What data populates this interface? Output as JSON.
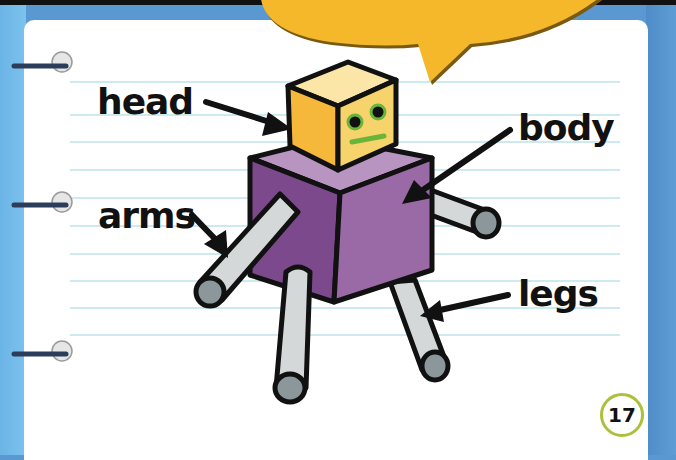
{
  "labels": {
    "head": "head",
    "body": "body",
    "arms": "arms",
    "legs": "legs"
  },
  "page_number": "17",
  "colors": {
    "background_blue": "#5a98d2",
    "page": "#ffffff",
    "ruled_line": "#cdeaf0",
    "speech_bubble": "#f5b82a",
    "head_front": "#f7d36b",
    "head_side": "#f5b83a",
    "head_top": "#fbe6a8",
    "body_front": "#9a6aa6",
    "body_side": "#7c4a8c",
    "body_top": "#b894c0",
    "limb": "#d5d8d8",
    "limb_end": "#8c979c",
    "eyes_ring": "#6ab43a",
    "mouth": "#6ab43a",
    "page_number_ring": "#a9c23a"
  }
}
